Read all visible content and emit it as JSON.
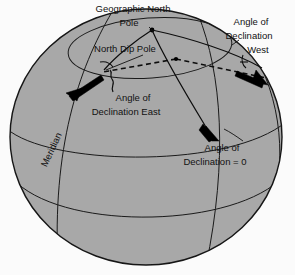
{
  "figure": {
    "background_color": "#fbfbfb",
    "sphere_fill": "#a8a8a8",
    "line_color": "#111111",
    "arrow_color": "#000000"
  },
  "labels": {
    "geographic_north_pole": {
      "line1": "Geographic North",
      "line2": "Pole",
      "x": 133,
      "y": 9,
      "anchor": "middle"
    },
    "north_dip_pole": {
      "line1": "North Dip Pole",
      "x": 125,
      "y": 49,
      "anchor": "middle"
    },
    "declination_west": {
      "line1": "Angle of",
      "line2": "Declination",
      "line3": "West",
      "x": 251,
      "y": 26,
      "anchor": "middle"
    },
    "declination_east": {
      "line1": "Angle of",
      "line2": "Declination East",
      "x": 126,
      "y": 101,
      "anchor": "middle"
    },
    "declination_zero": {
      "line1": "Angle of",
      "line2": "Declination = 0",
      "x": 222,
      "y": 151,
      "anchor": "middle"
    },
    "meridian": {
      "text": "Meridian",
      "x": 52,
      "y": 150,
      "rotation": -65
    }
  },
  "geometry": {
    "sphere": {
      "cx": 146,
      "cy": 137,
      "rx": 136,
      "ry": 128
    },
    "arctic_circle": {
      "cx": 150,
      "cy": 48,
      "rx": 82,
      "ry": 30,
      "rotation": -4
    },
    "north_pole_point": {
      "x": 152,
      "y": 30
    },
    "dip_pole_point": {
      "x": 176,
      "y": 59
    },
    "declination_values": {
      "east_label_value": "East",
      "west_label_value": "West",
      "zero_label_value": "0"
    }
  }
}
